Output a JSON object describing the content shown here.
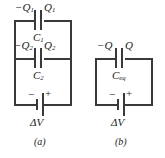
{
  "figure": {
    "stroke_color": "#3a3a3a",
    "text_color": "#1a1a1a",
    "background": "#ffffff"
  },
  "panel_a": {
    "label": "(a)",
    "capacitors": [
      {
        "name": "C",
        "subscript": "1",
        "charge_left": "−Q",
        "charge_left_sub": "1",
        "charge_right": "Q",
        "charge_right_sub": "1"
      },
      {
        "name": "C",
        "subscript": "2",
        "charge_left": "−Q",
        "charge_left_sub": "2",
        "charge_right": "Q",
        "charge_right_sub": "2"
      }
    ],
    "battery": {
      "negative_sign": "−",
      "positive_sign": "+",
      "voltage_label": "ΔV"
    }
  },
  "panel_b": {
    "label": "(b)",
    "capacitors": [
      {
        "name": "C",
        "subscript": "eq",
        "charge_left": "−Q",
        "charge_left_sub": "",
        "charge_right": "Q",
        "charge_right_sub": ""
      }
    ],
    "battery": {
      "negative_sign": "−",
      "positive_sign": "+",
      "voltage_label": "ΔV"
    }
  }
}
